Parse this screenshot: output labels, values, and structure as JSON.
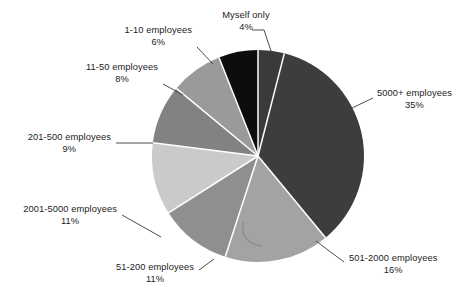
{
  "chart_data": {
    "type": "pie",
    "title": "",
    "subtitle": "",
    "xlabel": "",
    "ylabel": "",
    "legend_position": "callout-labels",
    "grid": false,
    "units": "percent",
    "start_angle_deg": 0,
    "direction": "clockwise",
    "categories": [
      "Myself only",
      "5000+ employees",
      "501-2000 employees",
      "51-200 employees",
      "2001-5000 employees",
      "201-500 employees",
      "11-50 employees",
      "1-10 employees"
    ],
    "values": [
      4,
      35,
      16,
      11,
      11,
      9,
      8,
      6
    ],
    "value_labels": [
      "4%",
      "35%",
      "16%",
      "11%",
      "11%",
      "9%",
      "8%",
      "6%"
    ],
    "colors": [
      "#3a3a3a",
      "#3d3d3d",
      "#a3a3a3",
      "#8f8f8f",
      "#cacaca",
      "#828282",
      "#9a9a9a",
      "#0d0d0d"
    ],
    "slice_divider_color": "#ffffff",
    "background_color": "#ffffff",
    "text_color": "#1c1c1c",
    "slices": [
      {
        "name": "Myself only",
        "percent_label": "4%",
        "value": 4,
        "color": "#3a3a3a",
        "label_align": "center"
      },
      {
        "name": "5000+ employees",
        "percent_label": "35%",
        "value": 35,
        "color": "#3d3d3d",
        "label_align": "center"
      },
      {
        "name": "501-2000 employees",
        "percent_label": "16%",
        "value": 16,
        "color": "#a3a3a3",
        "label_align": "center"
      },
      {
        "name": "51-200 employees",
        "percent_label": "11%",
        "value": 11,
        "color": "#8f8f8f",
        "label_align": "center"
      },
      {
        "name": "2001-5000 employees",
        "percent_label": "11%",
        "value": 11,
        "color": "#cacaca",
        "label_align": "center"
      },
      {
        "name": "201-500 employees",
        "percent_label": "9%",
        "value": 9,
        "color": "#828282",
        "label_align": "center"
      },
      {
        "name": "11-50 employees",
        "percent_label": "8%",
        "value": 8,
        "color": "#9a9a9a",
        "label_align": "center"
      },
      {
        "name": "1-10 employees",
        "percent_label": "6%",
        "value": 6,
        "color": "#0d0d0d",
        "label_align": "center"
      }
    ]
  }
}
